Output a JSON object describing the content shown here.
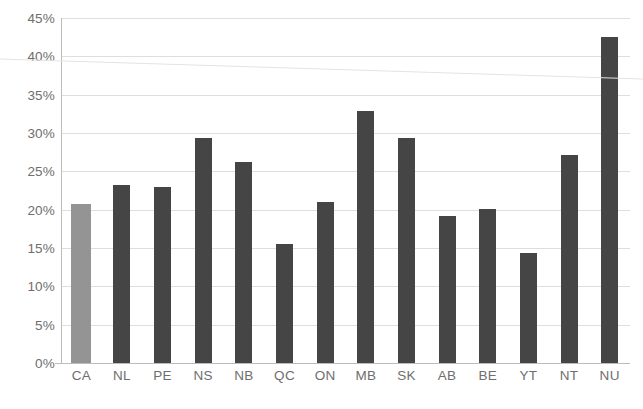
{
  "chart_data": {
    "type": "bar",
    "title": "",
    "subtitle": "",
    "xlabel": "",
    "ylabel": "",
    "categories": [
      "CA",
      "NL",
      "PE",
      "NS",
      "NB",
      "QC",
      "ON",
      "MB",
      "SK",
      "AB",
      "BE",
      "YT",
      "NT",
      "NU"
    ],
    "values": [
      20.8,
      23.2,
      22.9,
      29.3,
      26.2,
      15.5,
      21.0,
      32.9,
      29.3,
      19.2,
      20.1,
      14.4,
      27.1,
      42.5
    ],
    "value_labels": [
      "20.8%",
      "23.2%",
      "22.9%",
      "29.3%",
      "26.2%",
      "15.5%",
      "21.0%",
      "32.9%",
      "29.3%",
      "19.2%",
      "20.1%",
      "14.4%",
      "27.1%",
      "42.5%"
    ],
    "ylim": [
      0,
      45
    ],
    "ytick_values": [
      0,
      5,
      10,
      15,
      20,
      25,
      30,
      35,
      40,
      45
    ],
    "ytick_labels": [
      "0%",
      "5%",
      "10%",
      "15%",
      "20%",
      "25%",
      "30%",
      "35%",
      "40%",
      "45%"
    ],
    "grid": true,
    "grid_axis": "y",
    "legend": false,
    "legend_position": "none",
    "highlight_category": "CA",
    "colors": {
      "bar": "#454545",
      "bar_highlight": "#949494",
      "gridline": "#dededa",
      "axis_line": "#bdbdb8",
      "tick_label": "#6e6e6e",
      "background": "#ffffff"
    }
  }
}
